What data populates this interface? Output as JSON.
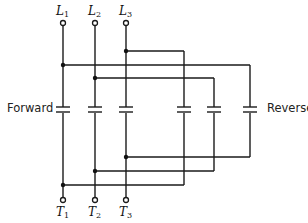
{
  "diagram": {
    "title": "",
    "labels": {
      "forward": "Forward",
      "reverse": "Reverse"
    },
    "line_terminals": [
      {
        "name": "L",
        "sub": "1"
      },
      {
        "name": "L",
        "sub": "2"
      },
      {
        "name": "L",
        "sub": "3"
      }
    ],
    "load_terminals": [
      {
        "name": "T",
        "sub": "1"
      },
      {
        "name": "T",
        "sub": "2"
      },
      {
        "name": "T",
        "sub": "3"
      }
    ],
    "contacts": {
      "forward": [
        "L1-T1",
        "L2-T2",
        "L3-T3"
      ],
      "reverse": [
        "L3-T1",
        "L1-T3",
        "L2-T2"
      ]
    },
    "colors": {
      "wire": "#1a1a1a",
      "background": "#ffffff"
    }
  }
}
